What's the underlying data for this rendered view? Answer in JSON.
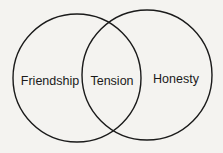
{
  "diagram": {
    "type": "venn",
    "sets": [
      {
        "name": "left-set",
        "label": "Friendship"
      },
      {
        "name": "right-set",
        "label": "Honesty"
      }
    ],
    "intersection": {
      "label": "Tension"
    },
    "colors": {
      "stroke": "#1a1a1a",
      "background": "#f4f3f0"
    }
  }
}
